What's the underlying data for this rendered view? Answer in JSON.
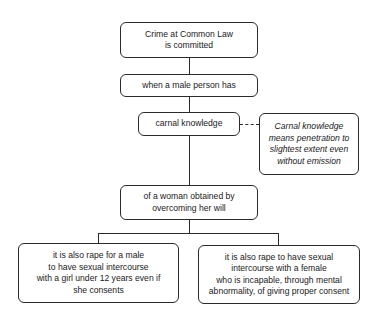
{
  "diagram": {
    "type": "flowchart",
    "nodes": [
      {
        "id": "crime",
        "text": "Crime at Common Law\nis committed"
      },
      {
        "id": "male",
        "text": "when a male person has"
      },
      {
        "id": "carnal",
        "text": "carnal knowledge"
      },
      {
        "id": "note",
        "text": "Carnal knowledge\nmeans penetration to\nslightest extent even\nwithout emission",
        "style": "italic"
      },
      {
        "id": "woman",
        "text": "of a woman obtained by\novercoming her will"
      },
      {
        "id": "girl",
        "text": "it is also rape for a male\nto have sexual intercourse\nwith a girl under 12 years even if\nshe consents"
      },
      {
        "id": "female",
        "text": "it is also rape to have sexual\nintercourse with a female\nwho is incapable, through mental\nabnormality, of giving proper consent"
      }
    ],
    "edges": [
      {
        "from": "crime",
        "to": "male",
        "style": "solid"
      },
      {
        "from": "male",
        "to": "carnal",
        "style": "solid"
      },
      {
        "from": "carnal",
        "to": "note",
        "style": "dashed"
      },
      {
        "from": "carnal",
        "to": "woman",
        "style": "solid"
      },
      {
        "from": "woman",
        "to": "girl",
        "style": "solid"
      },
      {
        "from": "woman",
        "to": "female",
        "style": "solid"
      }
    ]
  }
}
